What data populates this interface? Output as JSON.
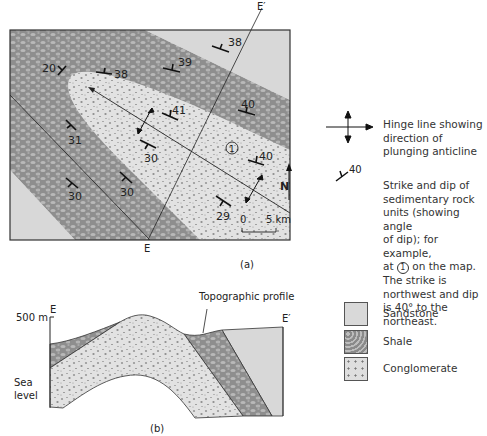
{
  "map": {
    "caption": "(a)",
    "section_start": "E",
    "section_end": "E′",
    "north_label": "N",
    "scale": {
      "start": "0",
      "end": "5 km"
    },
    "location_marker": "1",
    "measurements": [
      "20",
      "38",
      "39",
      "38",
      "41",
      "40",
      "40",
      "31",
      "30",
      "30",
      "29",
      "30"
    ]
  },
  "cross_section": {
    "caption": "(b)",
    "left_label": "E",
    "right_label": "E′",
    "elevation_label": "500 m",
    "sea_level_label_1": "Sea",
    "sea_level_label_2": "level",
    "callout": "Topographic profile"
  },
  "legend": {
    "hinge_line": "Hinge line showing direction of plunging anticline",
    "strike_dip_value": "40",
    "strike_dip_line1": "Strike and dip of",
    "strike_dip_line2": "sedimentary rock",
    "strike_dip_line3": "units (showing angle",
    "strike_dip_line4": "of dip); for example,",
    "strike_dip_line5_pre": "at",
    "strike_dip_line5_marker": "1",
    "strike_dip_line5_post": "on the map.",
    "strike_dip_line6": "The strike is",
    "strike_dip_line7": "northwest and dip",
    "strike_dip_line8": "is 40° to the",
    "strike_dip_line9": "northeast.",
    "units": [
      {
        "name": "Sandstone",
        "color": "#d9d9d9"
      },
      {
        "name": "Shale",
        "color": "#8f8f8f"
      },
      {
        "name": "Conglomerate",
        "color": "#dedede"
      }
    ]
  }
}
